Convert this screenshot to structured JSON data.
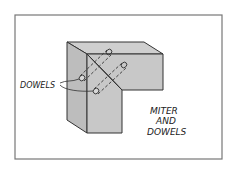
{
  "figure": {
    "caption": [
      "MITER",
      "AND",
      "DOWELS"
    ],
    "callout_label": "DOWELS",
    "colors": {
      "frame": "#777777",
      "face_front": "#c8c8c8",
      "face_top": "#cfcfcf",
      "face_side": "#bdbdbd",
      "line": "#333333"
    }
  }
}
